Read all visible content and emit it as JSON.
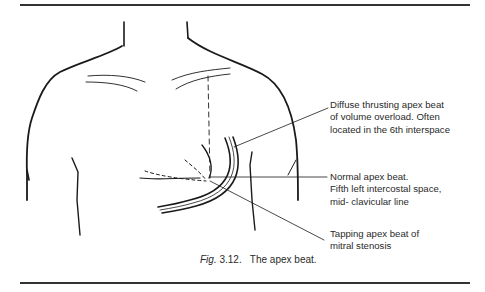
{
  "figure": {
    "labels": {
      "diffuse": "Diffuse thrusting apex beat\nof volume overload. Often\nlocated in the 6th interspace",
      "normal": "Normal apex beat.\nFifth left intercostal space,\nmid- clavicular line",
      "tapping": "Tapping apex beat of\nmitral stenosis"
    },
    "caption": {
      "prefix": "Fig.",
      "number": " 3.12.",
      "text": "   The apex beat."
    }
  }
}
